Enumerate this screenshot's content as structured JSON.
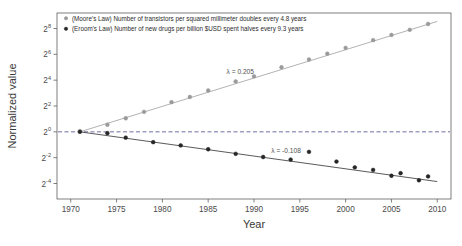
{
  "chart_data": {
    "type": "scatter",
    "title": "",
    "xlabel": "Year",
    "ylabel": "Normalized value",
    "xlim": [
      1968.5,
      2011.5
    ],
    "ylim": [
      -5.2,
      9.2
    ],
    "yscale": "log2",
    "grid": false,
    "legend_position": "top-left-inside",
    "xticks": [
      "1970",
      "1975",
      "1980",
      "1985",
      "1990",
      "1995",
      "2000",
      "2005",
      "2010"
    ],
    "xtick_values": [
      1970,
      1975,
      1980,
      1985,
      1990,
      1995,
      2000,
      2005,
      2010
    ],
    "yticks": [
      "2^8",
      "2^6",
      "2^4",
      "2^2",
      "2^0",
      "2^-2",
      "2^-4"
    ],
    "ytick_exponents": [
      8,
      6,
      4,
      2,
      0,
      -2,
      -4
    ],
    "reference_line": {
      "y_exponent": 0,
      "style": "dashed",
      "color": "#4a4a8c"
    },
    "series": [
      {
        "name": "moores-law",
        "label": "(Moore's Law) Number of transistors per squared millimeter doubles every 4.8 years",
        "color": "#9a9a9a",
        "marker": "circle",
        "lambda": 0.205,
        "lambda_label": "λ = 0.205",
        "x": [
          1971,
          1974,
          1976,
          1978,
          1981,
          1983,
          1985,
          1988,
          1990,
          1993,
          1996,
          1998,
          2000,
          2003,
          2005,
          2007,
          2009
        ],
        "y_exponent": [
          0.05,
          0.55,
          1.05,
          1.55,
          2.3,
          2.7,
          3.2,
          3.9,
          4.3,
          5.0,
          5.6,
          6.05,
          6.5,
          7.1,
          7.5,
          7.9,
          8.35
        ]
      },
      {
        "name": "erooms-law",
        "label": "(Eroom's Law) Number of new drugs per billion $USD spent halves every 9.3 years",
        "color": "#262626",
        "marker": "circle",
        "lambda": -0.108,
        "lambda_label": "λ = -0.108",
        "x": [
          1971,
          1974,
          1976,
          1979,
          1982,
          1985,
          1988,
          1991,
          1994,
          1996,
          1999,
          2001,
          2003,
          2005,
          2006,
          2008,
          2009
        ],
        "y_exponent": [
          0.0,
          -0.1,
          -0.45,
          -0.8,
          -1.05,
          -1.35,
          -1.7,
          -1.95,
          -2.15,
          -1.55,
          -2.3,
          -2.75,
          -2.95,
          -3.4,
          -3.2,
          -3.75,
          -3.45
        ]
      }
    ],
    "trend_lines": [
      {
        "name": "moores-trend",
        "color": "#9a9a9a",
        "x0": 1971,
        "y0_exponent": 0.0,
        "x1": 2010,
        "y1_exponent": 8.55
      },
      {
        "name": "erooms-trend",
        "color": "#262626",
        "x0": 1971,
        "y0_exponent": 0.0,
        "x1": 2010,
        "y1_exponent": -3.85
      }
    ]
  },
  "legend": {
    "entries": [
      {
        "marker_color": "#9a9a9a",
        "label": "(Moore's Law) Number of transistors per squared millimeter doubles every 4.8 years"
      },
      {
        "marker_color": "#262626",
        "label": "(Eroom's Law) Number of new drugs per billion $USD spent halves every 9.3 years"
      }
    ]
  },
  "annotations": [
    {
      "name": "lambda-moore",
      "text": "λ = 0.205"
    },
    {
      "name": "lambda-eroom",
      "text": "λ = -0.108"
    }
  ],
  "axes": {
    "x_title": "Year",
    "y_title": "Normalized value",
    "x_ticks": [
      "1970",
      "1975",
      "1980",
      "1985",
      "1990",
      "1995",
      "2000",
      "2005",
      "2010"
    ],
    "y_ticks": [
      {
        "base": "2",
        "exp": "8"
      },
      {
        "base": "2",
        "exp": "6"
      },
      {
        "base": "2",
        "exp": "4"
      },
      {
        "base": "2",
        "exp": "2"
      },
      {
        "base": "2",
        "exp": "0"
      },
      {
        "base": "2",
        "exp": "-2"
      },
      {
        "base": "2",
        "exp": "-4"
      }
    ]
  },
  "colors": {
    "background": "#ffffff",
    "frame": "#5f5f5f",
    "series_light": "#9a9a9a",
    "series_dark": "#262626",
    "reference": "#4a4a8c",
    "text": "#3a3a3a"
  }
}
